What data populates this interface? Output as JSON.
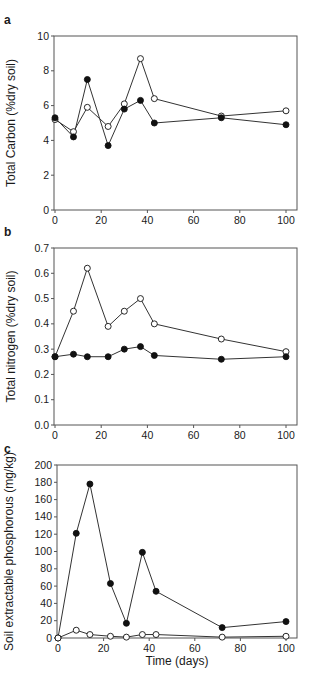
{
  "chart_data": [
    {
      "type": "line",
      "panel": "a",
      "title": "",
      "xlabel": "",
      "ylabel": "Total Carbon (%dry soil)",
      "xlim": [
        0,
        100
      ],
      "ylim": [
        0,
        10
      ],
      "xticks": [
        0,
        20,
        40,
        60,
        80,
        100
      ],
      "yticks": [
        0,
        2,
        4,
        6,
        8,
        10
      ],
      "ytick_labels": [
        "0",
        "2",
        "4",
        "6",
        "8",
        "10"
      ],
      "grid": false,
      "legend": null,
      "x": [
        0,
        8,
        14,
        23,
        30,
        37,
        43,
        72,
        100
      ],
      "series": [
        {
          "name": "open circles",
          "marker": "open",
          "values": [
            5.2,
            4.5,
            5.9,
            4.8,
            6.1,
            8.7,
            6.4,
            5.4,
            5.7
          ]
        },
        {
          "name": "filled circles",
          "marker": "filled",
          "values": [
            5.3,
            4.2,
            7.5,
            3.7,
            5.8,
            6.3,
            5.0,
            5.3,
            4.9
          ]
        }
      ]
    },
    {
      "type": "line",
      "panel": "b",
      "title": "",
      "xlabel": "",
      "ylabel": "Total nitrogen (%dry soil)",
      "xlim": [
        0,
        100
      ],
      "ylim": [
        0,
        0.7
      ],
      "xticks": [
        0,
        20,
        40,
        60,
        80,
        100
      ],
      "yticks": [
        0,
        0.1,
        0.2,
        0.3,
        0.4,
        0.5,
        0.6,
        0.7
      ],
      "ytick_labels": [
        "0.0",
        "0.1",
        "0.2",
        "0.3",
        "0.4",
        "0.5",
        "0.6",
        "0.7"
      ],
      "grid": false,
      "legend": null,
      "x": [
        0,
        8,
        14,
        23,
        30,
        37,
        43,
        72,
        100
      ],
      "series": [
        {
          "name": "open circles",
          "marker": "open",
          "values": [
            0.27,
            0.45,
            0.62,
            0.39,
            0.45,
            0.5,
            0.4,
            0.34,
            0.29
          ]
        },
        {
          "name": "filled circles",
          "marker": "filled",
          "values": [
            0.27,
            0.28,
            0.27,
            0.27,
            0.3,
            0.31,
            0.275,
            0.26,
            0.27
          ]
        }
      ]
    },
    {
      "type": "line",
      "panel": "c",
      "title": "",
      "xlabel": "Time (days)",
      "ylabel": "Soil extractable phosphorous (mg/kg)",
      "xlim": [
        0,
        100
      ],
      "ylim": [
        0,
        200
      ],
      "xticks": [
        0,
        20,
        40,
        60,
        80,
        100
      ],
      "yticks": [
        0,
        20,
        40,
        60,
        80,
        100,
        120,
        140,
        160,
        180,
        200
      ],
      "ytick_labels": [
        "0",
        "20",
        "40",
        "60",
        "80",
        "100",
        "120",
        "140",
        "160",
        "180",
        "200"
      ],
      "grid": false,
      "legend": null,
      "x": [
        0,
        8,
        14,
        23,
        30,
        37,
        43,
        72,
        100
      ],
      "series": [
        {
          "name": "filled circles",
          "marker": "filled",
          "values": [
            0,
            121,
            178,
            63,
            17,
            99,
            54,
            12,
            19
          ]
        },
        {
          "name": "open circles",
          "marker": "open",
          "values": [
            0,
            9,
            4,
            2,
            1,
            4,
            4,
            1,
            2
          ]
        }
      ]
    }
  ],
  "panels": [
    {
      "letter": "a",
      "top": 0,
      "height": 228,
      "plot": {
        "left": 54,
        "right": 297,
        "top": 36,
        "bottom": 210,
        "x0": 55,
        "x100": 286
      },
      "xaxis_labels": true,
      "xlabel_y": 0
    },
    {
      "letter": "b",
      "top": 222,
      "height": 225,
      "plot": {
        "left": 54,
        "right": 297,
        "top": 26,
        "bottom": 203,
        "x0": 55,
        "x100": 286
      },
      "xaxis_labels": true,
      "xlabel_y": 0
    },
    {
      "letter": "c",
      "top": 440,
      "height": 245,
      "plot": {
        "left": 57,
        "right": 297,
        "top": 25,
        "bottom": 198,
        "x0": 58,
        "x100": 286
      },
      "xaxis_labels": true,
      "xlabel_y": 225
    }
  ],
  "colors": {
    "axis": "#555555",
    "line": "#333333",
    "marker_fill": "#111111",
    "marker_open": "#ffffff"
  }
}
